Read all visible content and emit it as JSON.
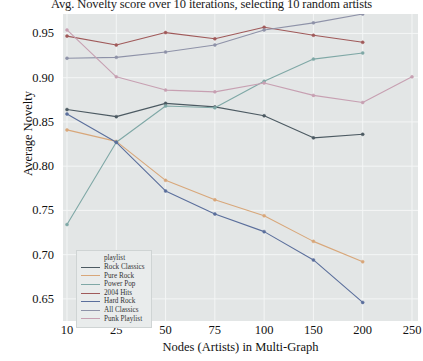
{
  "chart_data": {
    "type": "line",
    "title": "Avg. Novelty score over 10 iterations, selecting 10 random artists",
    "xlabel": "Nodes (Artists) in Multi-Graph",
    "ylabel": "Average Novelty",
    "x": [
      10,
      25,
      50,
      75,
      100,
      150,
      200,
      250
    ],
    "xtick_labels": [
      "10",
      "25",
      "50",
      "75",
      "100",
      "150",
      "200",
      "250"
    ],
    "ytick_labels": [
      "0.95",
      "0.90",
      "0.85",
      "0.80",
      "0.75",
      "0.70",
      "0.65"
    ],
    "ytick_values": [
      0.95,
      0.9,
      0.85,
      0.8,
      0.75,
      0.7,
      0.65
    ],
    "ylim": [
      0.625,
      0.972
    ],
    "xlim_index": [
      0,
      7
    ],
    "grid": true,
    "legend_position": "lower-left",
    "legend_title": "playlist",
    "series": [
      {
        "name": "Rock Classics",
        "color": "#4c5a62",
        "x": [
          10,
          25,
          50,
          75,
          100,
          150,
          200
        ],
        "values": [
          0.864,
          0.856,
          0.871,
          0.867,
          0.857,
          0.832,
          0.836
        ]
      },
      {
        "name": "Pure Rock",
        "color": "#d8a77a",
        "x": [
          10,
          25,
          50,
          75,
          100,
          150,
          200
        ],
        "values": [
          0.841,
          0.828,
          0.784,
          0.762,
          0.744,
          0.715,
          0.692
        ]
      },
      {
        "name": "Power Pop",
        "color": "#7fa8a6",
        "x": [
          10,
          25,
          50,
          75,
          100,
          150,
          200
        ],
        "values": [
          0.734,
          0.827,
          0.868,
          0.866,
          0.896,
          0.921,
          0.928
        ]
      },
      {
        "name": "2004 Hits",
        "color": "#a05a5a",
        "x": [
          10,
          25,
          50,
          75,
          100,
          150,
          200
        ],
        "values": [
          0.947,
          0.937,
          0.951,
          0.944,
          0.957,
          0.948,
          0.94
        ]
      },
      {
        "name": "Hard Rock",
        "color": "#5b6f9c",
        "x": [
          10,
          25,
          50,
          75,
          100,
          150,
          200
        ],
        "values": [
          0.859,
          0.827,
          0.772,
          0.746,
          0.726,
          0.694,
          0.646
        ]
      },
      {
        "name": "All Classics",
        "color": "#8e92a8",
        "x": [
          10,
          25,
          50,
          75,
          100,
          150,
          200
        ],
        "values": [
          0.922,
          0.923,
          0.929,
          0.937,
          0.954,
          0.962,
          0.972
        ]
      },
      {
        "name": "Punk Playlist",
        "color": "#c7a0b2",
        "x": [
          10,
          25,
          50,
          75,
          100,
          150,
          200,
          250
        ],
        "values": [
          0.954,
          0.901,
          0.886,
          0.884,
          0.894,
          0.88,
          0.872,
          0.901
        ]
      }
    ]
  }
}
